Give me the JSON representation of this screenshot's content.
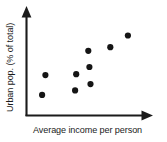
{
  "chart_data": {
    "type": "scatter",
    "title": "",
    "xlabel": "Average income per person",
    "ylabel": "Urban pop. (% of total)",
    "xlim": [
      0,
      100
    ],
    "ylim": [
      0,
      100
    ],
    "grid": false,
    "legend": null,
    "axis_ticks": {
      "x": [],
      "y": []
    },
    "axis_style": "arrow-headed L-shaped axes, no tick marks, no numeric scale",
    "series": [
      {
        "name": "Countries",
        "marker": "filled-circle",
        "color": "#151515",
        "points": [
          {
            "x": 11,
            "y": 19
          },
          {
            "x": 14,
            "y": 41
          },
          {
            "x": 41,
            "y": 24
          },
          {
            "x": 42,
            "y": 42
          },
          {
            "x": 55,
            "y": 31
          },
          {
            "x": 54,
            "y": 50
          },
          {
            "x": 53,
            "y": 68
          },
          {
            "x": 73,
            "y": 72
          },
          {
            "x": 89,
            "y": 85
          }
        ]
      }
    ]
  },
  "figure": {
    "point_radius_px": 3.1,
    "background_color": "#ffffff",
    "ink_color": "#1b1b1b"
  }
}
